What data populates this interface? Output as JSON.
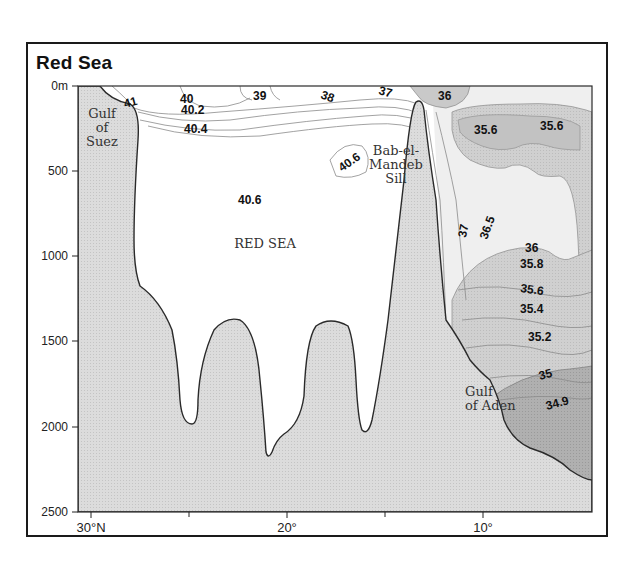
{
  "title": "Red Sea",
  "y_axis": {
    "unit_label": "0m",
    "ticks": [
      "0m",
      "500",
      "1000",
      "1500",
      "2000",
      "2500"
    ],
    "range": [
      0,
      2500
    ]
  },
  "x_axis": {
    "ticks": [
      "30°N",
      "20°",
      "10°"
    ],
    "minor_ticks": [
      "25°",
      "15°"
    ]
  },
  "places": {
    "gulf_of_suez": [
      "Gulf",
      "of",
      "Suez"
    ],
    "red_sea": "RED SEA",
    "bab_el_mandeb": [
      "Bab-el-",
      "Mandeb",
      "Sill"
    ],
    "gulf_of_aden": [
      "Gulf",
      "of Aden"
    ]
  },
  "contour_labels": {
    "c41": "41",
    "c40": "40",
    "c40_2": "40.2",
    "c40_4": "40.4",
    "c39": "39",
    "c38": "38",
    "c37_top": "37",
    "c36_top": "36",
    "c40_6_sill": "40.6",
    "c40_6_main": "40.6",
    "c35_6_a": "35.6",
    "c35_6_b": "35.6",
    "c37_mid": "37",
    "c36_5": "36.5",
    "c36_mid": "36",
    "c35_8": "35.8",
    "c35_6_c": "35.6",
    "c35_4": "35.4",
    "c35_2": "35.2",
    "c35": "35",
    "c34_9": "34.9"
  },
  "colors": {
    "land": "#d9d9d9",
    "water": "#ffffff",
    "salinity_light": "#ececec",
    "salinity_mid": "#cfcfcf",
    "salinity_dark": "#a9a9a9",
    "outline": "#2a2a2a"
  }
}
